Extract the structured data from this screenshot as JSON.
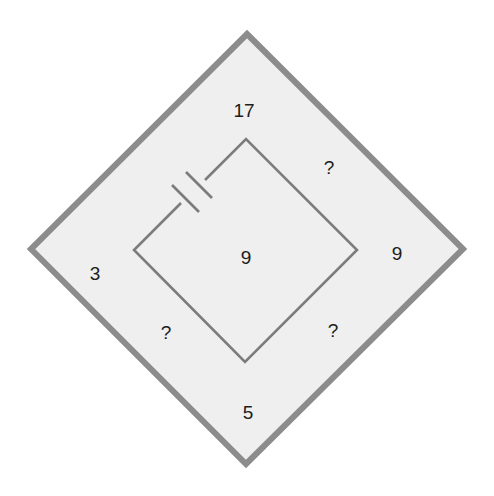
{
  "diagram": {
    "colors": {
      "background": "#ffffff",
      "fill": "#efefef",
      "outer_border": "#8c8c8c",
      "inner_wire": "#7c7c7c",
      "text": "#1c1c1c"
    },
    "labels": {
      "top": "17",
      "top_right": "?",
      "right": "9",
      "bottom_right": "?",
      "bottom": "5",
      "bottom_left": "?",
      "left": "3",
      "center": "9"
    },
    "components": {
      "battery": "battery-symbol on upper-left wire of inner loop"
    }
  }
}
